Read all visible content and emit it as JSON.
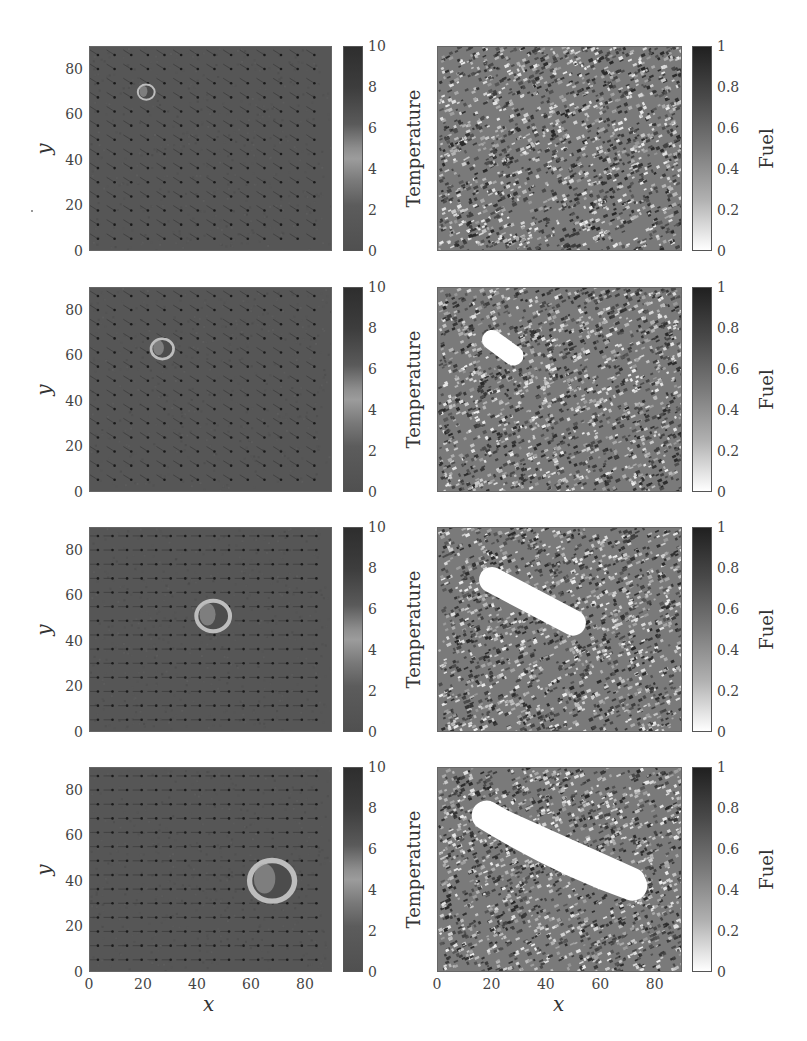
{
  "chart_data": [
    {
      "type": "heatmap",
      "row": 1,
      "column": "left",
      "field": "Temperature",
      "xlim": [
        0,
        90
      ],
      "ylim": [
        0,
        90
      ],
      "xlabel": "",
      "ylabel": "y",
      "yticks": [
        "0",
        "20",
        "40",
        "60",
        "80"
      ],
      "colorbar": {
        "label": "Temperature",
        "range": [
          0,
          10
        ],
        "ticks": [
          "0",
          "2",
          "4",
          "6",
          "8",
          "10"
        ]
      },
      "features": {
        "fire_front_center": [
          21,
          70
        ],
        "fire_front_radius": 3,
        "wind_direction": "down-right"
      }
    },
    {
      "type": "heatmap",
      "row": 1,
      "column": "right",
      "field": "Fuel",
      "xlim": [
        0,
        90
      ],
      "ylim": [
        0,
        90
      ],
      "colorbar": {
        "label": "Fuel",
        "range": [
          0,
          1
        ],
        "ticks": [
          "0",
          "0.2",
          "0.4",
          "0.6",
          "0.8",
          "1"
        ]
      },
      "features": {
        "burned_region": "none"
      }
    },
    {
      "type": "heatmap",
      "row": 2,
      "column": "left",
      "field": "Temperature",
      "xlim": [
        0,
        90
      ],
      "ylim": [
        0,
        90
      ],
      "ylabel": "y",
      "yticks": [
        "0",
        "20",
        "40",
        "60",
        "80"
      ],
      "colorbar": {
        "label": "Temperature",
        "range": [
          0,
          10
        ],
        "ticks": [
          "0",
          "2",
          "4",
          "6",
          "8",
          "10"
        ]
      },
      "features": {
        "fire_front_center": [
          27,
          63
        ],
        "fire_front_radius": 4,
        "wind_direction": "down-right"
      }
    },
    {
      "type": "heatmap",
      "row": 2,
      "column": "right",
      "field": "Fuel",
      "xlim": [
        0,
        90
      ],
      "ylim": [
        0,
        90
      ],
      "colorbar": {
        "label": "Fuel",
        "range": [
          0,
          1
        ],
        "ticks": [
          "0",
          "0.2",
          "0.4",
          "0.6",
          "0.8",
          "1"
        ]
      },
      "features": {
        "burned_region": {
          "from": [
            20,
            67
          ],
          "to": [
            28,
            60
          ]
        }
      }
    },
    {
      "type": "heatmap",
      "row": 3,
      "column": "left",
      "field": "Temperature",
      "xlim": [
        0,
        90
      ],
      "ylim": [
        0,
        90
      ],
      "ylabel": "y",
      "yticks": [
        "0",
        "20",
        "40",
        "60",
        "80"
      ],
      "colorbar": {
        "label": "Temperature",
        "range": [
          0,
          10
        ],
        "ticks": [
          "0",
          "2",
          "4",
          "6",
          "8",
          "10"
        ]
      },
      "features": {
        "fire_front_center": [
          46,
          51
        ],
        "fire_front_radius": 6,
        "wind_direction": "right"
      }
    },
    {
      "type": "heatmap",
      "row": 3,
      "column": "right",
      "field": "Fuel",
      "xlim": [
        0,
        90
      ],
      "ylim": [
        0,
        90
      ],
      "colorbar": {
        "label": "Fuel",
        "range": [
          0,
          1
        ],
        "ticks": [
          "0",
          "0.2",
          "0.4",
          "0.6",
          "0.8",
          "1"
        ]
      },
      "features": {
        "burned_region": {
          "from": [
            20,
            67
          ],
          "to": [
            50,
            48
          ]
        }
      }
    },
    {
      "type": "heatmap",
      "row": 4,
      "column": "left",
      "field": "Temperature",
      "xlim": [
        0,
        90
      ],
      "ylim": [
        0,
        90
      ],
      "xlabel": "x",
      "ylabel": "y",
      "xticks": [
        "0",
        "20",
        "40",
        "60",
        "80"
      ],
      "yticks": [
        "0",
        "20",
        "40",
        "60",
        "80"
      ],
      "colorbar": {
        "label": "Temperature",
        "range": [
          0,
          10
        ],
        "ticks": [
          "0",
          "2",
          "4",
          "6",
          "8",
          "10"
        ]
      },
      "features": {
        "fire_front_center": [
          68,
          40
        ],
        "fire_front_radius": 8,
        "wind_direction": "right"
      }
    },
    {
      "type": "heatmap",
      "row": 4,
      "column": "right",
      "field": "Fuel",
      "xlim": [
        0,
        90
      ],
      "ylim": [
        0,
        90
      ],
      "xlabel": "x",
      "xticks": [
        "0",
        "20",
        "40",
        "60",
        "80"
      ],
      "colorbar": {
        "label": "Fuel",
        "range": [
          0,
          1
        ],
        "ticks": [
          "0",
          "0.2",
          "0.4",
          "0.6",
          "0.8",
          "1"
        ]
      },
      "features": {
        "burned_region": {
          "from": [
            18,
            69
          ],
          "to": [
            72,
            40
          ]
        }
      }
    }
  ],
  "labels": {
    "y": "y",
    "x": "x",
    "temperature": "Temperature",
    "fuel": "Fuel"
  },
  "ticks": {
    "axis": [
      "0",
      "20",
      "40",
      "60",
      "80"
    ],
    "temp_cbar": [
      "10",
      "8",
      "6",
      "4",
      "2",
      "0"
    ],
    "fuel_cbar": [
      "1",
      "0.8",
      "0.6",
      "0.4",
      "0.2",
      "0"
    ]
  },
  "colors": {
    "temperature_background": "#565656",
    "fuel_noise_dark": "#3a3a3a",
    "fuel_noise_light": "#c8c8c8",
    "burned": "#ffffff",
    "fire_front": "#b8b8b8"
  }
}
